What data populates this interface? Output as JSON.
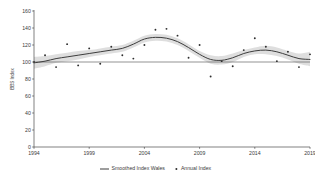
{
  "chart_data": {
    "type": "line",
    "title": "",
    "xlabel": "",
    "ylabel": "BBS Index",
    "xlim": [
      1994,
      2019
    ],
    "ylim": [
      0,
      160
    ],
    "ytick_values": [
      0,
      20,
      40,
      60,
      80,
      100,
      120,
      140,
      160
    ],
    "ytick_labels": [
      "0",
      "20",
      "40",
      "60",
      "80",
      "100",
      "120",
      "140",
      "160"
    ],
    "xtick_values": [
      1994,
      1999,
      2004,
      2009,
      2014,
      2019
    ],
    "xtick_labels": [
      "1994",
      "1999",
      "2004",
      "2009",
      "2014",
      "2019"
    ],
    "grid": false,
    "legend_position": "bottom",
    "legend": [
      {
        "label": "Smoothed Index Wales",
        "marker": "line",
        "color": "#3d3d3d"
      },
      {
        "label": "Annual Index",
        "marker": "point",
        "color": "#2e2e2e"
      }
    ],
    "reference_line": {
      "value": 100,
      "color": "#4a4a4a"
    },
    "series": [
      {
        "name": "Annual Index",
        "type": "scatter",
        "x": [
          1994,
          1995,
          1996,
          1997,
          1998,
          1999,
          2000,
          2001,
          2002,
          2003,
          2004,
          2005,
          2006,
          2007,
          2008,
          2009,
          2010,
          2011,
          2012,
          2013,
          2014,
          2015,
          2016,
          2017,
          2018,
          2019
        ],
        "values": [
          100,
          108,
          94,
          121,
          96,
          116,
          98,
          118,
          108,
          104,
          120,
          138,
          139,
          131,
          105,
          120,
          83,
          101,
          95,
          114,
          128,
          118,
          101,
          112,
          94,
          109
        ]
      },
      {
        "name": "Smoothed Index Wales",
        "type": "line",
        "x": [
          1994,
          1995,
          1996,
          1997,
          1998,
          1999,
          2000,
          2001,
          2002,
          2003,
          2004,
          2005,
          2006,
          2007,
          2008,
          2009,
          2010,
          2011,
          2012,
          2013,
          2014,
          2015,
          2016,
          2017,
          2018,
          2019
        ],
        "values": [
          99,
          101,
          104,
          106,
          108,
          110,
          112,
          114,
          116,
          121,
          127,
          129,
          128,
          124,
          117,
          109,
          103,
          102,
          105,
          110,
          113,
          114,
          112,
          108,
          104,
          103
        ],
        "ci_lower": [
          92,
          95,
          99,
          101,
          103,
          106,
          108,
          110,
          112,
          117,
          123,
          125,
          124,
          120,
          113,
          105,
          98,
          97,
          100,
          106,
          109,
          109,
          107,
          103,
          98,
          95
        ],
        "ci_upper": [
          106,
          107,
          109,
          111,
          113,
          114,
          116,
          118,
          120,
          125,
          131,
          133,
          132,
          128,
          121,
          113,
          108,
          107,
          110,
          114,
          117,
          119,
          117,
          113,
          110,
          112
        ]
      }
    ]
  }
}
